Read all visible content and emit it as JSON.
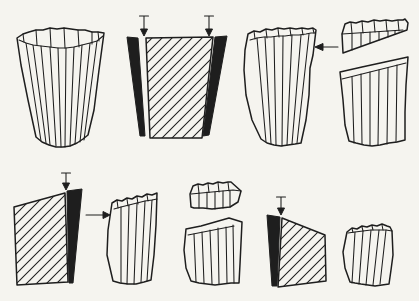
{
  "colors": {
    "paper": "#f5f4ef",
    "ink": "#1e1e1e"
  },
  "diagram": {
    "rows": 2,
    "figure_count": 10,
    "figures": [
      {
        "name": "intact-cup-specimen",
        "row": "top",
        "description": "Fluted cup-shaped wood specimen, wider at the top, vertical facet lines",
        "icons": []
      },
      {
        "name": "compressed-cross-section",
        "row": "top",
        "description": "Hatched trapezoidal cross-section flanked by two solid black wedges with two arrows pressing down from above",
        "icons": [
          "down-arrow-icon",
          "down-arrow-icon"
        ]
      },
      {
        "name": "specimen-with-lateral-load",
        "row": "top",
        "description": "Fluted prismatic specimen with a horizontal arrow pointing left at its upper right side",
        "icons": [
          "left-arrow-icon"
        ]
      },
      {
        "name": "sheared-specimen",
        "row": "top",
        "description": "Fluted prism broken into a cap and a lower piece along a diagonal shear plane",
        "icons": []
      },
      {
        "name": "section-with-right-wedge",
        "row": "bottom",
        "description": "Hatched quadrilateral section with a solid black wedge at its right edge and an arrow pressing down on the wedge",
        "icons": [
          "down-arrow-icon"
        ]
      },
      {
        "name": "lateral-load-arrow",
        "row": "bottom",
        "description": "Horizontal arrow pointing right toward the short specimen",
        "icons": [
          "right-arrow-icon"
        ]
      },
      {
        "name": "short-intact-specimen",
        "row": "bottom",
        "description": "Short fluted wood specimen, slightly wider at the top",
        "icons": []
      },
      {
        "name": "short-sheared-specimen",
        "row": "bottom",
        "description": "Short specimen broken into a cap and a lower piece along a diagonal plane",
        "icons": []
      },
      {
        "name": "section-with-left-wedge",
        "row": "bottom",
        "description": "Solid black wedge on the left of a hatched leaning quadrilateral section with an arrow pressing down",
        "icons": [
          "down-arrow-icon"
        ]
      },
      {
        "name": "tilted-specimen",
        "row": "bottom",
        "description": "Small fluted specimen leaning slightly to one side",
        "icons": []
      }
    ]
  }
}
